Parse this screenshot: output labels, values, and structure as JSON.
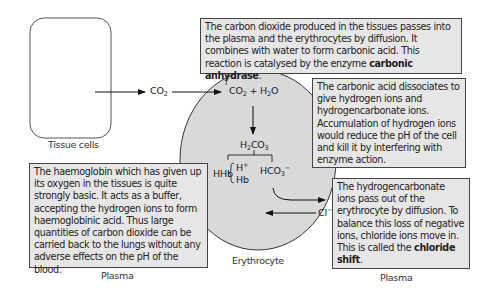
{
  "labels": {
    "tissue_cells": "Tissue cells",
    "erythrocyte": "Erythrocyte",
    "plasma_left": "Plasma",
    "plasma_right": "Plasma"
  },
  "chemistry": {
    "co2_outside": {
      "base": "CO",
      "sub": "2"
    },
    "co2_h2o": {
      "a": "CO",
      "a_sub": "2",
      "plus": " + H",
      "b_sub": "2",
      "b": "O"
    },
    "h2co3": {
      "a": "H",
      "a_sub": "2",
      "b": "CO",
      "b_sub": "3"
    },
    "hhb": "HHb",
    "h_ion": {
      "base": "H",
      "sup": "+"
    },
    "hb": "Hb",
    "hco3": {
      "base": "HCO",
      "sub": "3",
      "sup": "−"
    },
    "cl_ion": {
      "base": "Cl",
      "sup": "−"
    }
  },
  "boxes": {
    "top": {
      "text": "The carbon dioxide produced in the tissues passes into the plasma and the erythrocytes by diffusion.  It combines with water to form carbonic acid.  This reaction is catalysed by the enzyme ",
      "bold": "carbonic anhydrase",
      "end": "."
    },
    "right_middle": {
      "text": "The carbonic acid dissociates to give hydrogen ions and hydrogencarbonate ions. Accumulation of hydrogen ions would reduce the pH of the cell and kill it by interfering with enzyme action."
    },
    "left_bottom": {
      "text": "The haemoglobin which has given up its oxygen in the tissues is quite strongly basic.  It acts as a buffer, accepting the hydrogen ions to form haemoglobinic acid.  Thus large quantities of carbon dioxide can be carried back to the lungs without any adverse effects on the pH of the blood."
    },
    "right_bottom": {
      "text": "The hydrogencarbonate ions pass out of the erythrocyte by diffusion. To balance this loss of negative ions, chloride ions move in.  This is called the ",
      "bold": "chloride shift",
      "end": "."
    }
  },
  "colors": {
    "box_fill": "#e6e6e6",
    "cell_fill": "#d9d9d9",
    "stroke": "#333333"
  }
}
